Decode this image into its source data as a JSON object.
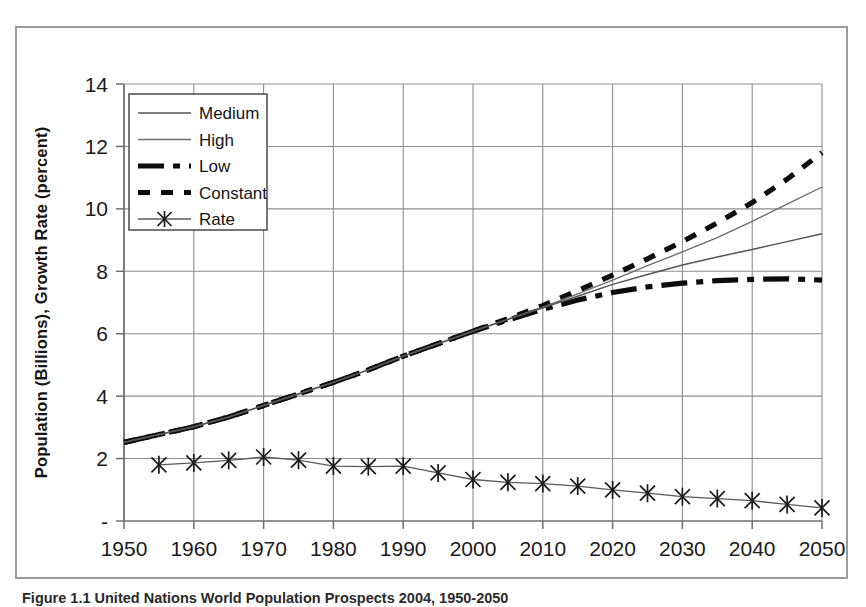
{
  "figure": {
    "caption": "Figure 1.1   United Nations World Population Prospects 2004, 1950-2050"
  },
  "chart_data": {
    "type": "line",
    "title": "",
    "xlabel": "",
    "ylabel": "Population (Billions), Growth Rate (percent)",
    "xlim": [
      1950,
      2050
    ],
    "ylim": [
      0,
      14
    ],
    "xticks": [
      "1950",
      "1960",
      "1970",
      "1980",
      "1990",
      "2000",
      "2010",
      "2020",
      "2030",
      "2040",
      "2050"
    ],
    "xtick_values": [
      1950,
      1960,
      1970,
      1980,
      1990,
      2000,
      2010,
      2020,
      2030,
      2040,
      2050
    ],
    "yticks": [
      "-",
      "2",
      "4",
      "6",
      "8",
      "10",
      "12",
      "14"
    ],
    "ytick_values": [
      0,
      2,
      4,
      6,
      8,
      10,
      12,
      14
    ],
    "grid": true,
    "legend_position": "upper-left-inside",
    "x": [
      1950,
      1955,
      1960,
      1965,
      1970,
      1975,
      1980,
      1985,
      1990,
      1995,
      2000,
      2005,
      2010,
      2015,
      2020,
      2025,
      2030,
      2035,
      2040,
      2045,
      2050
    ],
    "series": [
      {
        "name": "Medium",
        "style": "thin-solid",
        "values": [
          2.52,
          2.77,
          3.02,
          3.33,
          3.7,
          4.07,
          4.44,
          4.84,
          5.28,
          5.68,
          6.08,
          6.46,
          6.83,
          7.2,
          7.58,
          7.9,
          8.2,
          8.46,
          8.7,
          8.95,
          9.2
        ]
      },
      {
        "name": "High",
        "style": "thin-light-solid",
        "values": [
          2.52,
          2.77,
          3.02,
          3.33,
          3.7,
          4.07,
          4.44,
          4.84,
          5.28,
          5.68,
          6.08,
          6.46,
          6.85,
          7.28,
          7.72,
          8.18,
          8.62,
          9.08,
          9.6,
          10.15,
          10.7
        ]
      },
      {
        "name": "Low",
        "style": "thick-dash-dot",
        "values": [
          2.52,
          2.77,
          3.02,
          3.33,
          3.7,
          4.07,
          4.44,
          4.84,
          5.28,
          5.68,
          6.08,
          6.44,
          6.78,
          7.08,
          7.32,
          7.5,
          7.62,
          7.7,
          7.74,
          7.76,
          7.72
        ]
      },
      {
        "name": "Constant",
        "style": "thick-dotted",
        "values": [
          2.52,
          2.77,
          3.02,
          3.33,
          3.7,
          4.07,
          4.44,
          4.84,
          5.28,
          5.68,
          6.08,
          6.48,
          6.9,
          7.38,
          7.88,
          8.4,
          8.95,
          9.55,
          10.2,
          10.95,
          11.8
        ]
      },
      {
        "name": "Rate",
        "style": "thin-solid-with-x-markers",
        "marker": "x",
        "x": [
          1955,
          1960,
          1965,
          1970,
          1975,
          1980,
          1985,
          1990,
          1995,
          2000,
          2005,
          2010,
          2015,
          2020,
          2025,
          2030,
          2035,
          2040,
          2045,
          2050
        ],
        "values": [
          1.8,
          1.86,
          1.94,
          2.05,
          1.95,
          1.76,
          1.74,
          1.76,
          1.54,
          1.33,
          1.24,
          1.2,
          1.12,
          1.0,
          0.89,
          0.78,
          0.72,
          0.65,
          0.53,
          0.42
        ]
      }
    ]
  },
  "legend": {
    "items": [
      {
        "label": "Medium",
        "swatch": "thin-solid-swatch"
      },
      {
        "label": "High",
        "swatch": "thin-light-solid-swatch"
      },
      {
        "label": "Low",
        "swatch": "thick-dash-dot-swatch"
      },
      {
        "label": "Constant",
        "swatch": "thick-dotted-swatch"
      },
      {
        "label": "Rate",
        "swatch": "x-marker-line-swatch"
      }
    ]
  }
}
